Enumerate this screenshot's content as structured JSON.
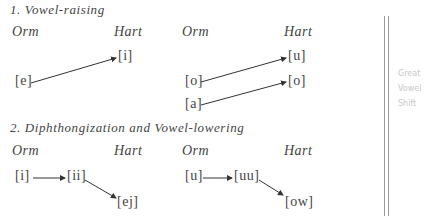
{
  "section1": {
    "title": "1. Vowel-raising",
    "left": {
      "col_from": "Orm",
      "col_to": "Hart",
      "from": [
        "[e]"
      ],
      "to": [
        "[i]"
      ]
    },
    "right": {
      "col_from": "Orm",
      "col_to": "Hart",
      "from": [
        "[o]",
        "[a]"
      ],
      "to": [
        "[u]",
        "[o]"
      ]
    }
  },
  "section2": {
    "title": "2. Diphthongization and Vowel-lowering",
    "left": {
      "col_from": "Orm",
      "col_to": "Hart",
      "steps": [
        "[i]",
        "[ii]",
        "[ej]"
      ]
    },
    "right": {
      "col_from": "Orm",
      "col_to": "Hart",
      "steps": [
        "[u]",
        "[uu]",
        "[ow]"
      ]
    }
  },
  "margin_note": {
    "lines": [
      "Great",
      "Vowel",
      "Shift"
    ]
  },
  "colors": {
    "text": "#444444",
    "margin_line": "#9a9a9a",
    "pencil": "#c8c8c8"
  }
}
